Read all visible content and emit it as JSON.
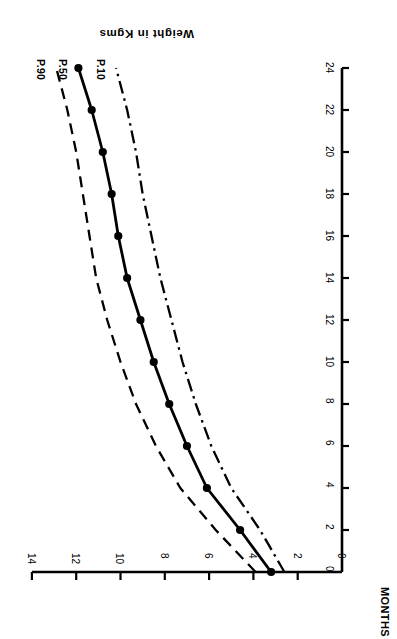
{
  "figure": {
    "rotation_degrees": 180,
    "background_color": "#ffffff",
    "ink_color": "#000000"
  },
  "axes": {
    "x_title": "MONTHS",
    "y_title": "Weight in Kgms",
    "x_ticks": [
      "0",
      "2",
      "4",
      "6",
      "8",
      "10",
      "12",
      "14",
      "16",
      "18",
      "20",
      "22",
      "24"
    ],
    "y_ticks": [
      "0",
      "2",
      "4",
      "6",
      "8",
      "10",
      "12",
      "14"
    ]
  },
  "curve_labels": {
    "p90": "P.90",
    "p50": "P.50",
    "p10": "P.10"
  },
  "chart_data": {
    "type": "line",
    "title": "",
    "subtitle": "",
    "xlabel": "MONTHS",
    "ylabel": "Weight in Kgms",
    "xlim": [
      0,
      24
    ],
    "ylim": [
      0,
      14
    ],
    "xticks": [
      0,
      2,
      4,
      6,
      8,
      10,
      12,
      14,
      16,
      18,
      20,
      22,
      24
    ],
    "yticks": [
      0,
      2,
      4,
      6,
      8,
      10,
      12,
      14
    ],
    "grid": false,
    "legend_position": "inline-curve-labels",
    "annotations": [
      "P.90",
      "P.50",
      "P.10"
    ],
    "x": [
      0,
      2,
      4,
      6,
      8,
      10,
      12,
      14,
      16,
      18,
      20,
      22,
      24
    ],
    "series": [
      {
        "name": "P.90",
        "linestyle": "dashed",
        "marker": "none",
        "values": [
          3.9,
          5.7,
          7.3,
          8.4,
          9.3,
          10.0,
          10.6,
          11.1,
          11.4,
          11.7,
          12.0,
          12.4,
          12.9
        ]
      },
      {
        "name": "P.50",
        "linestyle": "solid",
        "marker": "filled-circle",
        "values": [
          3.2,
          4.6,
          6.1,
          7.0,
          7.8,
          8.5,
          9.1,
          9.7,
          10.1,
          10.4,
          10.8,
          11.3,
          11.9
        ]
      },
      {
        "name": "P.10",
        "linestyle": "dash-dot",
        "marker": "none",
        "values": [
          2.6,
          3.7,
          5.0,
          5.9,
          6.6,
          7.2,
          7.7,
          8.2,
          8.6,
          9.0,
          9.3,
          9.7,
          10.2
        ]
      }
    ]
  }
}
